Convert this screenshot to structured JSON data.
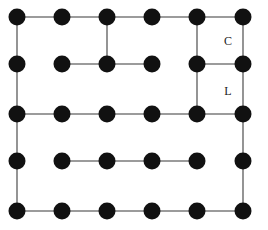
{
  "diagram": {
    "type": "lattice-graph",
    "background_color": "#ffffff",
    "width": 268,
    "height": 230,
    "columns": 6,
    "rows": 5,
    "node_count": 30,
    "node_radius": 8.5,
    "node_color": "#111111",
    "edge_color": "#7a7a7a",
    "edge_width": 1.6,
    "column_x": [
      17,
      62,
      107,
      152,
      197,
      243
    ],
    "row_y": [
      17,
      64,
      114,
      161,
      211
    ],
    "nodes": [
      {
        "id": "r1c1",
        "row": 0,
        "col": 0,
        "x": 17,
        "y": 17
      },
      {
        "id": "r1c2",
        "row": 0,
        "col": 1,
        "x": 62,
        "y": 17
      },
      {
        "id": "r1c3",
        "row": 0,
        "col": 2,
        "x": 107,
        "y": 17
      },
      {
        "id": "r1c4",
        "row": 0,
        "col": 3,
        "x": 152,
        "y": 17
      },
      {
        "id": "r1c5",
        "row": 0,
        "col": 4,
        "x": 197,
        "y": 17
      },
      {
        "id": "r1c6",
        "row": 0,
        "col": 5,
        "x": 243,
        "y": 17
      },
      {
        "id": "r2c1",
        "row": 1,
        "col": 0,
        "x": 17,
        "y": 64
      },
      {
        "id": "r2c2",
        "row": 1,
        "col": 1,
        "x": 62,
        "y": 64
      },
      {
        "id": "r2c3",
        "row": 1,
        "col": 2,
        "x": 107,
        "y": 64
      },
      {
        "id": "r2c4",
        "row": 1,
        "col": 3,
        "x": 152,
        "y": 64
      },
      {
        "id": "r2c5",
        "row": 1,
        "col": 4,
        "x": 197,
        "y": 64
      },
      {
        "id": "r2c6",
        "row": 1,
        "col": 5,
        "x": 243,
        "y": 64
      },
      {
        "id": "r3c1",
        "row": 2,
        "col": 0,
        "x": 17,
        "y": 114
      },
      {
        "id": "r3c2",
        "row": 2,
        "col": 1,
        "x": 62,
        "y": 114
      },
      {
        "id": "r3c3",
        "row": 2,
        "col": 2,
        "x": 107,
        "y": 114
      },
      {
        "id": "r3c4",
        "row": 2,
        "col": 3,
        "x": 152,
        "y": 114
      },
      {
        "id": "r3c5",
        "row": 2,
        "col": 4,
        "x": 197,
        "y": 114
      },
      {
        "id": "r3c6",
        "row": 2,
        "col": 5,
        "x": 243,
        "y": 114
      },
      {
        "id": "r4c1",
        "row": 3,
        "col": 0,
        "x": 17,
        "y": 161
      },
      {
        "id": "r4c2",
        "row": 3,
        "col": 1,
        "x": 62,
        "y": 161
      },
      {
        "id": "r4c3",
        "row": 3,
        "col": 2,
        "x": 107,
        "y": 161
      },
      {
        "id": "r4c4",
        "row": 3,
        "col": 3,
        "x": 152,
        "y": 161
      },
      {
        "id": "r4c5",
        "row": 3,
        "col": 4,
        "x": 197,
        "y": 161
      },
      {
        "id": "r4c6",
        "row": 3,
        "col": 5,
        "x": 243,
        "y": 161
      },
      {
        "id": "r5c1",
        "row": 4,
        "col": 0,
        "x": 17,
        "y": 211
      },
      {
        "id": "r5c2",
        "row": 4,
        "col": 1,
        "x": 62,
        "y": 211
      },
      {
        "id": "r5c3",
        "row": 4,
        "col": 2,
        "x": 107,
        "y": 211
      },
      {
        "id": "r5c4",
        "row": 4,
        "col": 3,
        "x": 152,
        "y": 211
      },
      {
        "id": "r5c5",
        "row": 4,
        "col": 4,
        "x": 197,
        "y": 211
      },
      {
        "id": "r5c6",
        "row": 4,
        "col": 5,
        "x": 243,
        "y": 211
      }
    ],
    "edges": [
      {
        "from": "r1c1",
        "to": "r1c2",
        "orientation": "horizontal"
      },
      {
        "from": "r1c2",
        "to": "r1c3",
        "orientation": "horizontal"
      },
      {
        "from": "r1c3",
        "to": "r1c4",
        "orientation": "horizontal"
      },
      {
        "from": "r1c4",
        "to": "r1c5",
        "orientation": "horizontal"
      },
      {
        "from": "r1c5",
        "to": "r1c6",
        "orientation": "horizontal"
      },
      {
        "from": "r2c2",
        "to": "r2c3",
        "orientation": "horizontal"
      },
      {
        "from": "r2c3",
        "to": "r2c4",
        "orientation": "horizontal"
      },
      {
        "from": "r2c5",
        "to": "r2c6",
        "orientation": "horizontal"
      },
      {
        "from": "r3c1",
        "to": "r3c2",
        "orientation": "horizontal"
      },
      {
        "from": "r3c2",
        "to": "r3c3",
        "orientation": "horizontal"
      },
      {
        "from": "r3c3",
        "to": "r3c4",
        "orientation": "horizontal"
      },
      {
        "from": "r3c4",
        "to": "r3c5",
        "orientation": "horizontal"
      },
      {
        "from": "r3c5",
        "to": "r3c6",
        "orientation": "horizontal"
      },
      {
        "from": "r4c2",
        "to": "r4c3",
        "orientation": "horizontal"
      },
      {
        "from": "r4c3",
        "to": "r4c4",
        "orientation": "horizontal"
      },
      {
        "from": "r4c4",
        "to": "r4c5",
        "orientation": "horizontal"
      },
      {
        "from": "r5c1",
        "to": "r5c2",
        "orientation": "horizontal"
      },
      {
        "from": "r5c2",
        "to": "r5c3",
        "orientation": "horizontal"
      },
      {
        "from": "r5c3",
        "to": "r5c4",
        "orientation": "horizontal"
      },
      {
        "from": "r5c4",
        "to": "r5c5",
        "orientation": "horizontal"
      },
      {
        "from": "r5c5",
        "to": "r5c6",
        "orientation": "horizontal"
      },
      {
        "from": "r1c1",
        "to": "r2c1",
        "orientation": "vertical"
      },
      {
        "from": "r2c1",
        "to": "r3c1",
        "orientation": "vertical"
      },
      {
        "from": "r3c1",
        "to": "r4c1",
        "orientation": "vertical"
      },
      {
        "from": "r4c1",
        "to": "r5c1",
        "orientation": "vertical"
      },
      {
        "from": "r1c3",
        "to": "r2c3",
        "orientation": "vertical"
      },
      {
        "from": "r1c5",
        "to": "r2c5",
        "orientation": "vertical"
      },
      {
        "from": "r2c5",
        "to": "r3c5",
        "orientation": "vertical"
      },
      {
        "from": "r1c6",
        "to": "r2c6",
        "orientation": "vertical"
      },
      {
        "from": "r2c6",
        "to": "r3c6",
        "orientation": "vertical"
      },
      {
        "from": "r3c6",
        "to": "r4c6",
        "orientation": "vertical"
      },
      {
        "from": "r4c6",
        "to": "r5c6",
        "orientation": "vertical"
      }
    ],
    "labels": [
      {
        "id": "label-c",
        "text": "C",
        "x": 228,
        "y": 42
      },
      {
        "id": "label-l",
        "text": "L",
        "x": 228,
        "y": 92
      }
    ]
  }
}
